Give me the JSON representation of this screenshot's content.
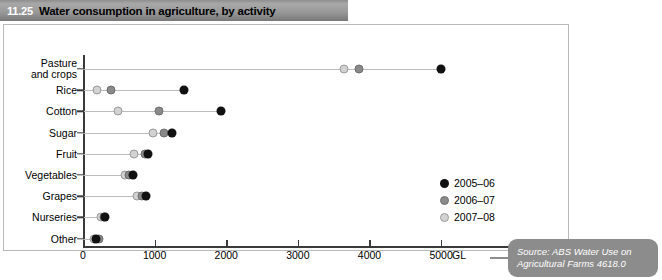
{
  "title": {
    "number": "11.25",
    "text": "Water consumption in agriculture, by activity"
  },
  "source": {
    "line1": "Source: ABS Water Use on",
    "line2": "Agricultural Farms 4618.0"
  },
  "legend": [
    {
      "label": "2005–06",
      "color": "#111111"
    },
    {
      "label": "2006–07",
      "color": "#8a8a8a"
    },
    {
      "label": "2007–08",
      "color": "#d2d2d2"
    }
  ],
  "chart_data": {
    "type": "scatter",
    "title": "Water consumption in agriculture, by activity",
    "xlabel": "GL",
    "ylabel": "",
    "xlim": [
      0,
      5300
    ],
    "xticks": [
      0,
      1000,
      2000,
      3000,
      4000,
      5000
    ],
    "xtick_labels": [
      "0",
      "1000",
      "2000",
      "3000",
      "4000",
      "5000"
    ],
    "unit": "GL",
    "grid": false,
    "legend_position": "inside-right",
    "categories": [
      "Pasture and crops",
      "Rice",
      "Cotton",
      "Sugar",
      "Fruit",
      "Vegetables",
      "Grapes",
      "Nurseries",
      "Other"
    ],
    "series": [
      {
        "name": "2005–06",
        "color": "#111111",
        "values": [
          5000,
          1410,
          1930,
          1240,
          910,
          700,
          880,
          310,
          180
        ]
      },
      {
        "name": "2006–07",
        "color": "#8a8a8a",
        "values": [
          3860,
          390,
          1060,
          1130,
          860,
          640,
          820,
          300,
          230
        ]
      },
      {
        "name": "2007–08",
        "color": "#d2d2d2",
        "values": [
          3650,
          195,
          490,
          980,
          710,
          590,
          750,
          250,
          150
        ]
      }
    ]
  }
}
